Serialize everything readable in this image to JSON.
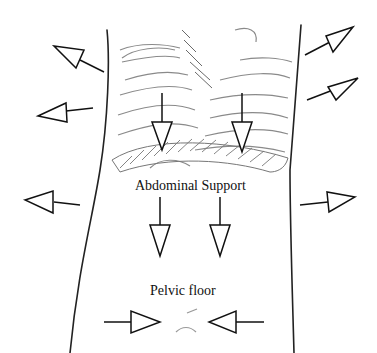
{
  "diagram": {
    "labels": {
      "abdominal_support": "Abdominal Support",
      "pelvic_floor": "Pelvic floor"
    },
    "colors": {
      "background": "#ffffff",
      "ink": "#111111",
      "sketch": "#8a8a8a",
      "hatch": "#6a6a6a"
    },
    "arrows": [
      {
        "id": "upper-left-out",
        "direction": "up-left"
      },
      {
        "id": "mid-left-out",
        "direction": "left"
      },
      {
        "id": "lower-left-out",
        "direction": "left"
      },
      {
        "id": "upper-right-out",
        "direction": "up-right"
      },
      {
        "id": "mid-right-out",
        "direction": "up-right"
      },
      {
        "id": "lower-right-out",
        "direction": "right"
      },
      {
        "id": "diaphragm-left-down",
        "direction": "down"
      },
      {
        "id": "diaphragm-right-down",
        "direction": "down"
      },
      {
        "id": "abdomen-left-down",
        "direction": "down"
      },
      {
        "id": "abdomen-right-down",
        "direction": "down"
      },
      {
        "id": "pelvic-left-in",
        "direction": "right"
      },
      {
        "id": "pelvic-right-in",
        "direction": "left"
      }
    ]
  }
}
